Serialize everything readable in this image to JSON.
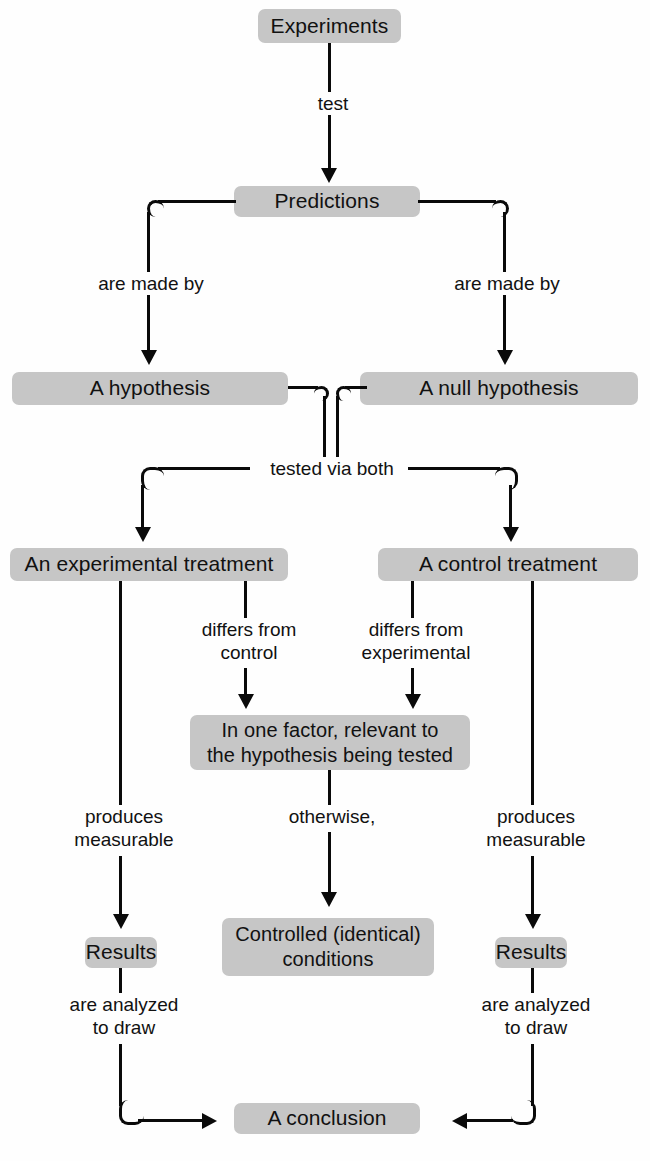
{
  "diagram": {
    "colors": {
      "node_fill": "#c6c6c6",
      "line": "#0a0a0a",
      "background": "#fefefe",
      "text": "#111111"
    },
    "nodes": {
      "experiments": "Experiments",
      "predictions": "Predictions",
      "hypothesis": "A hypothesis",
      "null_hypothesis": "A null hypothesis",
      "experimental_treatment": "An experimental treatment",
      "control_treatment": "A control treatment",
      "one_factor": "In one factor, relevant to\nthe hypothesis being tested",
      "results_left": "Results",
      "controlled_conditions": "Controlled (identical)\nconditions",
      "results_right": "Results",
      "conclusion": "A conclusion"
    },
    "edge_labels": {
      "test": "test",
      "are_made_by_left": "are made by",
      "are_made_by_right": "are made by",
      "tested_via_both": "tested via both",
      "differs_from_control": "differs from\ncontrol",
      "differs_from_experimental": "differs from\nexperimental",
      "produces_measurable_left": "produces\nmeasurable",
      "otherwise": "otherwise,",
      "produces_measurable_right": "produces\nmeasurable",
      "are_analyzed_left": "are analyzed\nto draw",
      "are_analyzed_right": "are analyzed\nto draw"
    }
  }
}
